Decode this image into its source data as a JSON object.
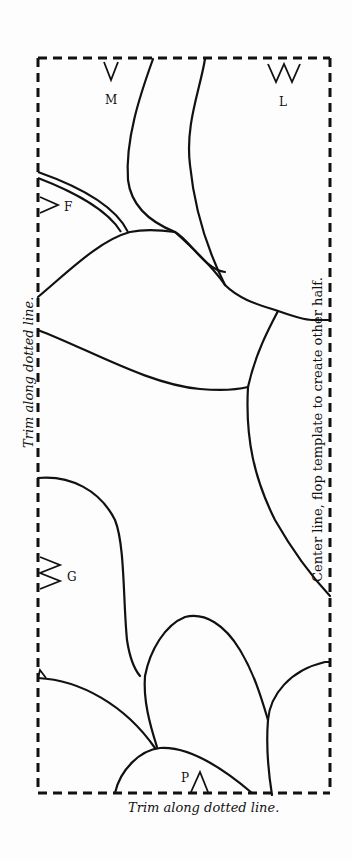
{
  "template": {
    "frame": {
      "left": 38,
      "top": 58,
      "right": 330,
      "bottom": 793,
      "stroke_color": "#111111",
      "dash": "9 6"
    },
    "line_color": "#111111",
    "markers": [
      {
        "id": "M",
        "label": "M",
        "type": "single-notch"
      },
      {
        "id": "L",
        "label": "L",
        "type": "double-notch"
      },
      {
        "id": "F",
        "label": "F",
        "type": "single-notch"
      },
      {
        "id": "G",
        "label": "G",
        "type": "double-notch"
      },
      {
        "id": "P",
        "label": "P",
        "type": "single-notch"
      }
    ],
    "captions": {
      "left_trim": "Trim along dotted line.",
      "bottom_trim": "Trim along dotted line.",
      "center_line": "Center line, flop template to create other half."
    }
  }
}
